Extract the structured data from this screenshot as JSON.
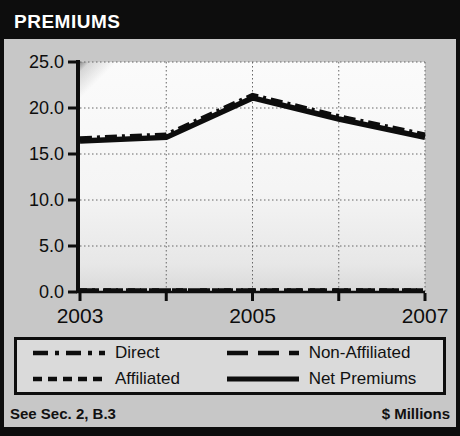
{
  "title_bar": {
    "title": "PREMIUMS"
  },
  "footer": {
    "left": "See Sec. 2, B.3",
    "right": "$ Millions"
  },
  "colors": {
    "frame": "#0d0d0d",
    "background": "#c7c7c7",
    "plot_background": "#f5f5f5",
    "line": "#0d0d0d",
    "grid": "#666666",
    "legend_background": "#dadada",
    "title_text": "#ffffff"
  },
  "chart_data": {
    "type": "line",
    "title": "PREMIUMS",
    "units": "$ Millions",
    "x": [
      2003,
      2004,
      2005,
      2006,
      2007
    ],
    "x_tick_labels": [
      "2003",
      "2005",
      "2007"
    ],
    "x_tick_label_years": [
      2003,
      2005,
      2007
    ],
    "xlim": [
      2003,
      2007
    ],
    "y_ticks": [
      0,
      5,
      10,
      15,
      20,
      25
    ],
    "y_tick_labels": [
      "0.0",
      "5.0",
      "10.0",
      "15.0",
      "20.0",
      "25.0"
    ],
    "ylim": [
      0,
      25
    ],
    "grid": true,
    "legend_position": "bottom",
    "legend_order": [
      "Direct",
      "Non-Affiliated",
      "Affiliated",
      "Net Premiums"
    ],
    "series": [
      {
        "name": "Affiliated",
        "line_style": "short-dash",
        "values": [
          0.0,
          0.0,
          0.0,
          0.0,
          0.0
        ]
      },
      {
        "name": "Non-Affiliated",
        "line_style": "long-dash",
        "values": [
          0.0,
          0.0,
          0.0,
          0.0,
          0.0
        ]
      },
      {
        "name": "Net Premiums",
        "line_style": "solid",
        "values": [
          16.4,
          16.8,
          21.1,
          18.8,
          16.8
        ]
      },
      {
        "name": "Direct",
        "line_style": "dash-dot",
        "values": [
          16.7,
          17.1,
          21.4,
          19.1,
          17.1
        ]
      }
    ]
  }
}
